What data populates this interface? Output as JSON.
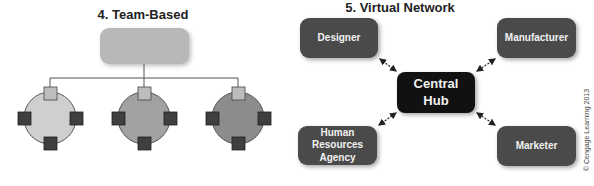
{
  "team_based": {
    "title": "4. Team-Based",
    "top_box_color": "#b8b8b8",
    "teams": [
      {
        "circle_color": "#cfcfcf"
      },
      {
        "circle_color": "#a2a2a2"
      },
      {
        "circle_color": "#8c8c8c"
      }
    ],
    "member_top_color": "#bdbdbd",
    "member_color": "#3f3f3f"
  },
  "virtual_network": {
    "title": "5. Virtual Network",
    "hub": {
      "label": "Central\nHub",
      "color": "#111111"
    },
    "nodes": [
      {
        "label": "Designer"
      },
      {
        "label": "Manufacturer"
      },
      {
        "label": "Human\nResources\nAgency"
      },
      {
        "label": "Marketer"
      }
    ],
    "node_color": "#4a4a4a"
  },
  "copyright": "© Cengage Learning 2013"
}
